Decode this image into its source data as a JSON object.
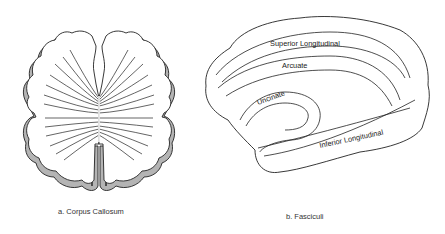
{
  "figure": {
    "panels": [
      {
        "id": "a",
        "caption": "a.  Corpus Callosum",
        "structure": "corpus-callosum-coronal"
      },
      {
        "id": "b",
        "caption": "b.  Fasciculi",
        "structure": "lateral-hemisphere-fasciculi",
        "tracts": [
          {
            "label": "Superior  Longitudinal"
          },
          {
            "label": "Arcuate"
          },
          {
            "label": "Uncinate"
          },
          {
            "label": "Inferior Longitudinal"
          }
        ]
      }
    ],
    "colors": {
      "outline": "#222222",
      "cortex_shadow": "#b4b4b4",
      "background": "#ffffff"
    }
  }
}
